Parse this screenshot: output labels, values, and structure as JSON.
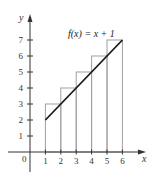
{
  "chart_data": {
    "type": "bar",
    "title": "",
    "annotation": "f(x) = x + 1",
    "xlabel": "x",
    "ylabel": "y",
    "origin_label": "0",
    "x_ticks": [
      1,
      2,
      3,
      4,
      5,
      6
    ],
    "y_ticks": [
      1,
      2,
      3,
      4,
      5,
      6,
      7
    ],
    "xlim": [
      0,
      6.5
    ],
    "ylim": [
      0,
      7.5
    ],
    "grid": false,
    "rectangles": [
      {
        "x_left": 1,
        "x_right": 2,
        "height": 3
      },
      {
        "x_left": 2,
        "x_right": 3,
        "height": 4
      },
      {
        "x_left": 3,
        "x_right": 4,
        "height": 5
      },
      {
        "x_left": 4,
        "x_right": 5,
        "height": 6
      },
      {
        "x_left": 5,
        "x_right": 6,
        "height": 7
      }
    ],
    "series": [
      {
        "name": "f(x) = x + 1",
        "type": "line",
        "x": [
          1,
          6
        ],
        "y": [
          2,
          7
        ]
      }
    ]
  },
  "colors": {
    "axis": "#333333",
    "rectangle_stroke": "#a0a0a0",
    "function_line": "#1a1a1a"
  }
}
